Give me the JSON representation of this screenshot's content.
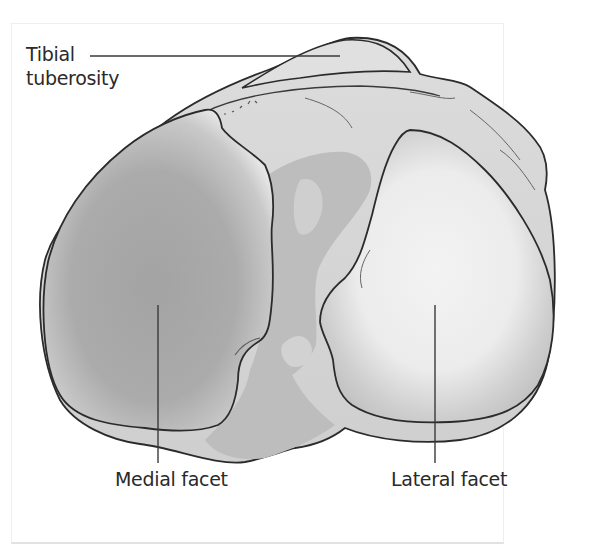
{
  "figure": {
    "labels": {
      "tibial_tuberosity_line1": "Tibial",
      "tibial_tuberosity_line2": "tuberosity",
      "medial_facet": "Medial facet",
      "lateral_facet": "Lateral facet"
    },
    "colors": {
      "outline": "#2b2b2b",
      "bone_fill": "#d6d6d6",
      "bone_shadow": "#b9b9b9",
      "medial_facet_fill": "#a9a9a9",
      "lateral_facet_fill": "#efefef",
      "label_text": "#2a2a2a",
      "leader_line": "#3a3a3a",
      "frame_border": "#eeeeee"
    }
  }
}
